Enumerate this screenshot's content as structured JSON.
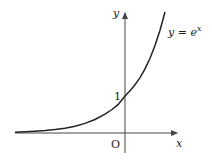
{
  "diagram": {
    "type": "function-graph",
    "axes": {
      "x_label": "x",
      "y_label": "y",
      "origin_label": "O"
    },
    "curve": {
      "label_lhs": "y = e",
      "label_exp": "x",
      "function": "y = e^x"
    },
    "ticks": {
      "y_intercept_label": "1"
    },
    "colors": {
      "curve": "#222222",
      "axes": "#444444",
      "background": "#ffffff"
    }
  }
}
